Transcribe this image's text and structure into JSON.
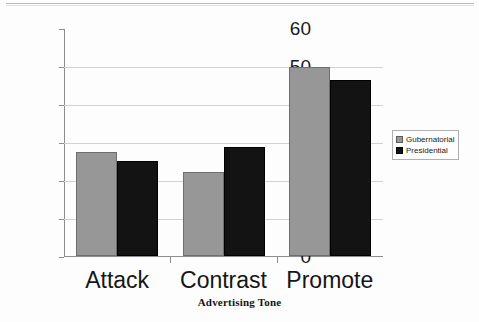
{
  "chart_data": {
    "type": "bar",
    "title": "",
    "subtitle": "",
    "xlabel": "Advertising Tone",
    "ylabel": "Percent",
    "categories": [
      "Attack",
      "Contrast",
      "Promote"
    ],
    "series": [
      {
        "name": "Gubernatorial",
        "color": "#979797",
        "values": [
          27.5,
          22.2,
          49.8
        ]
      },
      {
        "name": "Presidential",
        "color": "#131313",
        "values": [
          25.0,
          28.6,
          46.3
        ]
      }
    ],
    "ylim": [
      0,
      60
    ],
    "ytick_labels": [
      "0",
      "10",
      "20",
      "30",
      "40",
      "50",
      "60"
    ],
    "ytick_values": [
      0,
      10,
      20,
      30,
      40,
      50,
      60
    ],
    "grid": true,
    "legend_position": "right",
    "legend_entries": [
      "Gubernatorial",
      "Presidential"
    ]
  },
  "figure": {
    "top_rule": "horizontal-rule"
  }
}
